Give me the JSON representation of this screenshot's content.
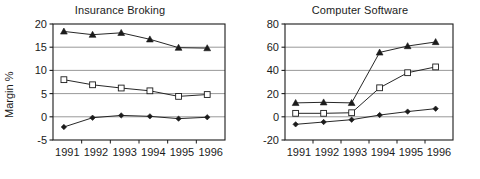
{
  "figure": {
    "background": "#ffffff",
    "ink_color": "#1b1b1b",
    "gridline_color": "#8d8d8d",
    "axis_label_left": "Margin %"
  },
  "chart_data": [
    {
      "type": "line",
      "title": "Insurance Broking",
      "xlabel": "",
      "ylabel": "Margin %",
      "x": [
        "1991",
        "1992",
        "1993",
        "1994",
        "1995",
        "1996"
      ],
      "categories": [
        "1991",
        "1992",
        "1993",
        "1994",
        "1995",
        "1996"
      ],
      "ylim": [
        -5,
        20
      ],
      "yticks": [
        -5,
        0,
        5,
        10,
        15,
        20
      ],
      "ytick_labels": [
        "-5",
        "0",
        "5",
        "10",
        "15",
        "20"
      ],
      "grid": "horizontal",
      "legend": "none",
      "series": [
        {
          "name": "series-triangle",
          "marker": "triangle-filled",
          "values": [
            18.4,
            17.7,
            18.1,
            16.7,
            14.9,
            14.8
          ]
        },
        {
          "name": "series-square",
          "marker": "square-open",
          "values": [
            8.0,
            6.9,
            6.2,
            5.6,
            4.4,
            4.8
          ]
        },
        {
          "name": "series-diamond",
          "marker": "diamond-filled",
          "values": [
            -2.2,
            -0.2,
            0.3,
            0.1,
            -0.4,
            -0.1
          ]
        }
      ]
    },
    {
      "type": "line",
      "title": "Computer Software",
      "xlabel": "",
      "ylabel": "",
      "x": [
        "1991",
        "1992",
        "1993",
        "1994",
        "1995",
        "1996"
      ],
      "categories": [
        "1991",
        "1992",
        "1993",
        "1994",
        "1995",
        "1996"
      ],
      "ylim": [
        -20,
        80
      ],
      "yticks": [
        -20,
        0,
        20,
        40,
        60,
        80
      ],
      "ytick_labels": [
        "-20",
        "0",
        "20",
        "40",
        "60",
        "80"
      ],
      "grid": "horizontal",
      "legend": "none",
      "series": [
        {
          "name": "series-triangle",
          "marker": "triangle-filled",
          "values": [
            12.0,
            12.5,
            12.0,
            55.5,
            61.0,
            64.5
          ]
        },
        {
          "name": "series-square",
          "marker": "square-open",
          "values": [
            3.0,
            3.0,
            3.5,
            25.0,
            38.0,
            43.0
          ]
        },
        {
          "name": "series-diamond",
          "marker": "diamond-filled",
          "values": [
            -6.5,
            -4.5,
            -2.5,
            1.5,
            4.5,
            7.0
          ]
        }
      ]
    }
  ]
}
